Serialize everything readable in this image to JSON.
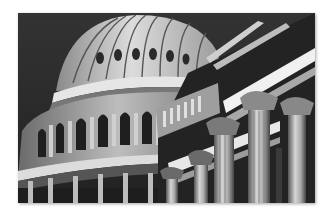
{
  "image": {
    "subject": "Capitol dome and Corinthian columns (black-and-white photograph)",
    "style": "grayscale",
    "colors": {
      "sky": "#2b2b2b",
      "dome_light": "#d9d9d9",
      "dome_mid": "#9a9a9a",
      "shadow": "#1a1a1a",
      "column_light": "#cfcfcf",
      "background": "#ffffff"
    }
  }
}
